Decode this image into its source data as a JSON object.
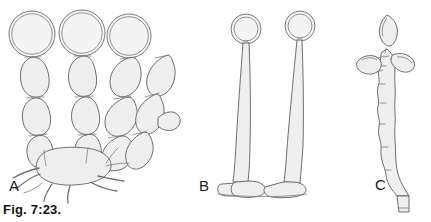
{
  "figure": {
    "caption": "Fig. 7:23.",
    "background_color": "#ffffff",
    "ink_color": "#5a5a5a",
    "fill_color": "#f2f2f2",
    "panels": [
      {
        "id": "A",
        "label": "A",
        "x": 9,
        "y": 177,
        "subject": "branched chains of oval cells with large terminal spherical spores arising from a basal cell with radiating hyphae"
      },
      {
        "id": "B",
        "label": "B",
        "x": 199,
        "y": 177,
        "subject": "two long slender stalks each bearing a single round terminal spore, rising from a common basal cell"
      },
      {
        "id": "C",
        "label": "C",
        "x": 375,
        "y": 176,
        "subject": "rough irregular stalk bearing three lemon-shaped spores near the apex"
      }
    ]
  },
  "panel_a": {
    "spheres": [
      {
        "cx": 32,
        "cy": 34,
        "r": 23
      },
      {
        "cx": 82,
        "cy": 33,
        "r": 23
      },
      {
        "cx": 129,
        "cy": 36,
        "r": 22
      }
    ],
    "basal_cell": {
      "cx": 78,
      "cy": 158,
      "rx": 30,
      "ry": 19
    },
    "hypha_count": 6,
    "chain_count": 4
  },
  "panel_b": {
    "stalk_count": 2,
    "heads": [
      {
        "cx": 246,
        "cy": 29,
        "r": 15
      },
      {
        "cx": 300,
        "cy": 26,
        "r": 15
      }
    ],
    "base": {
      "x": 222,
      "y": 180,
      "w": 86,
      "h": 14
    }
  },
  "panel_c": {
    "spore_count": 3,
    "spores": [
      {
        "cx": 371,
        "cy": 62,
        "rx": 12,
        "ry": 8,
        "rot": -8
      },
      {
        "cx": 399,
        "cy": 60,
        "rx": 12,
        "ry": 8,
        "rot": 22
      },
      {
        "cx": 387,
        "cy": 29,
        "rx": 9,
        "ry": 14,
        "rot": 4
      }
    ],
    "stalk_base": {
      "x": 399,
      "y": 196,
      "w": 10,
      "h": 16
    }
  }
}
